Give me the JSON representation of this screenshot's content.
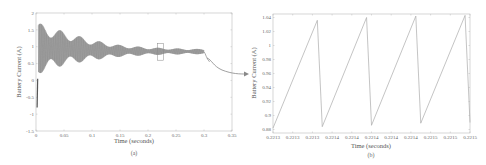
{
  "chart_data": [
    {
      "id": "a",
      "type": "line",
      "caption": "(a)",
      "title": "",
      "xlabel": "Time (seconds)",
      "ylabel": "Battery Current (A)",
      "xlim": [
        0,
        0.35
      ],
      "ylim": [
        -1.5,
        2
      ],
      "xticks": [
        "0",
        "0.05",
        "0.1",
        "0.15",
        "0.2",
        "0.25",
        "0.3",
        "0.35"
      ],
      "yticks": [
        "-1.5",
        "-1",
        "-0.5",
        "0",
        "0.5",
        "1",
        "1.5",
        "2"
      ],
      "grid": false,
      "description": "Oscillating battery current, envelope decaying from ~0.2-1.7 A at t≈0.005s to ~0.75-0.95 A at t=0.3s; initial transient from about -0.8 A to 0 A near t=0",
      "series": [
        {
          "name": "Battery Current",
          "envelope_upper": {
            "x": [
              0.005,
              0.05,
              0.1,
              0.15,
              0.2,
              0.25,
              0.3
            ],
            "y": [
              1.7,
              1.45,
              1.2,
              1.05,
              0.98,
              0.95,
              0.93
            ]
          },
          "envelope_lower": {
            "x": [
              0.005,
              0.05,
              0.1,
              0.15,
              0.2,
              0.25,
              0.3
            ],
            "y": [
              0.2,
              0.45,
              0.6,
              0.7,
              0.75,
              0.77,
              0.78
            ]
          },
          "startup": {
            "x": [
              0,
              0.003
            ],
            "y": [
              -0.8,
              0.05
            ]
          }
        }
      ],
      "annotations": [
        {
          "type": "zoom-box",
          "x_range": [
            0.217,
            0.228
          ],
          "y_range": [
            0.6,
            1.1
          ],
          "label": ""
        }
      ]
    },
    {
      "id": "b",
      "type": "line",
      "caption": "(b)",
      "title": "",
      "xlabel": "Time (seconds)",
      "ylabel": "Battery Current (A)",
      "ylim": [
        0.875,
        1.045
      ],
      "xticks": [
        "0.2213",
        "0.2213",
        "0.2213",
        "0.2214",
        "0.2214",
        "0.2214",
        "0.2214",
        "0.2214",
        "0.2215",
        "0.2215",
        "0.2215"
      ],
      "yticks": [
        "0.88",
        "0.9",
        "0.92",
        "0.94",
        "0.96",
        "0.98",
        "1",
        "1.02",
        "1.04"
      ],
      "grid": false,
      "description": "Zoomed sawtooth waveform of battery current",
      "series": [
        {
          "name": "Battery Current",
          "x_norm": [
            0.0,
            0.225,
            0.25,
            0.475,
            0.5,
            0.725,
            0.75,
            0.975,
            1.0
          ],
          "y": [
            0.882,
            1.036,
            0.884,
            1.04,
            0.886,
            1.042,
            0.889,
            1.043,
            0.89
          ]
        }
      ]
    }
  ],
  "connector": {
    "type": "arrow",
    "from": "a.zoom-box",
    "to": "b"
  }
}
